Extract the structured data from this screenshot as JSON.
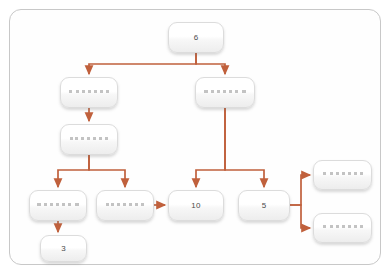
{
  "diagram": {
    "type": "flowchart",
    "title": "",
    "frame": {
      "border_color": "#c8c8c8",
      "background": "#ffffff"
    },
    "connector_color": "#c0603c",
    "node_style": {
      "fill_top": "#ffffff",
      "fill_bottom": "#ededed",
      "border_color": "#dcdcdc",
      "text_color": "#4a4a4a"
    },
    "nodes": [
      {
        "id": "n1",
        "label": "6",
        "legible": true,
        "x": 168,
        "y": 22,
        "w": 56,
        "h": 31
      },
      {
        "id": "n2",
        "label": "",
        "legible": false,
        "x": 60,
        "y": 77,
        "w": 58,
        "h": 31
      },
      {
        "id": "n3",
        "label": "",
        "legible": false,
        "x": 195,
        "y": 77,
        "w": 60,
        "h": 31
      },
      {
        "id": "n4",
        "label": "",
        "legible": false,
        "x": 60,
        "y": 124,
        "w": 58,
        "h": 31
      },
      {
        "id": "n5",
        "label": "",
        "legible": false,
        "x": 29,
        "y": 190,
        "w": 58,
        "h": 31
      },
      {
        "id": "n6",
        "label": "",
        "legible": false,
        "x": 96,
        "y": 190,
        "w": 58,
        "h": 31
      },
      {
        "id": "n7",
        "label": "10",
        "legible": true,
        "x": 168,
        "y": 190,
        "w": 56,
        "h": 31
      },
      {
        "id": "n8",
        "label": "5",
        "legible": true,
        "x": 238,
        "y": 190,
        "w": 52,
        "h": 31
      },
      {
        "id": "n9",
        "label": "",
        "legible": false,
        "x": 313,
        "y": 160,
        "w": 59,
        "h": 30
      },
      {
        "id": "n10",
        "label": "",
        "legible": false,
        "x": 313,
        "y": 213,
        "w": 59,
        "h": 30
      },
      {
        "id": "n11",
        "label": "3",
        "legible": true,
        "x": 40,
        "y": 235,
        "w": 47,
        "h": 27
      }
    ],
    "edges": [
      {
        "from": "n1",
        "to": "n2",
        "kind": "split-down-left"
      },
      {
        "from": "n1",
        "to": "n3",
        "kind": "split-down-right"
      },
      {
        "from": "n2",
        "to": "n4",
        "kind": "down"
      },
      {
        "from": "n4",
        "to": "n5",
        "kind": "split-down-left"
      },
      {
        "from": "n4",
        "to": "n6",
        "kind": "split-down-right"
      },
      {
        "from": "n6",
        "to": "n7",
        "kind": "right"
      },
      {
        "from": "n3",
        "to": "n7",
        "kind": "split-down-left"
      },
      {
        "from": "n3",
        "to": "n8",
        "kind": "split-down-right"
      },
      {
        "from": "n8",
        "to": "n9",
        "kind": "split-right-up"
      },
      {
        "from": "n8",
        "to": "n10",
        "kind": "split-right-down"
      },
      {
        "from": "n5",
        "to": "n11",
        "kind": "down"
      }
    ]
  }
}
